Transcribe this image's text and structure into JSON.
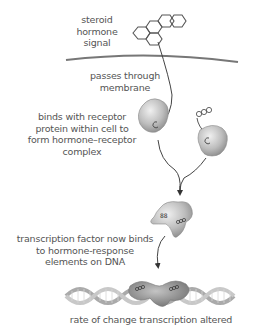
{
  "diagram": {
    "topic": "steroid hormone signaling",
    "colors": {
      "text": "#555555",
      "line": "#444444",
      "membrane": "#777777",
      "protein_light": "#d8d8d8",
      "protein_dark": "#8a8a8a",
      "dna": "#bdbdbd"
    },
    "labels": {
      "signal": [
        "steroid",
        "hormone",
        "signal"
      ],
      "membrane": [
        "passes through",
        "membrane"
      ],
      "binding": [
        "binds with receptor",
        "protein within cell to",
        "form hormone–receptor",
        "complex"
      ],
      "transcription_factor": [
        "transcription factor now binds",
        "to hormone-response",
        "elements on DNA"
      ],
      "result": "rate of change transcription altered"
    },
    "nodes": [
      {
        "id": "hormone",
        "icon": "steroid-ring-structure"
      },
      {
        "id": "cell-membrane",
        "icon": "membrane-line"
      },
      {
        "id": "receptor-1",
        "icon": "receptor-protein-blob"
      },
      {
        "id": "receptor-2",
        "icon": "receptor-protein-blob"
      },
      {
        "id": "hormone-receptor-complex",
        "icon": "dimer-complex"
      },
      {
        "id": "dna",
        "icon": "dna-double-helix"
      }
    ]
  }
}
